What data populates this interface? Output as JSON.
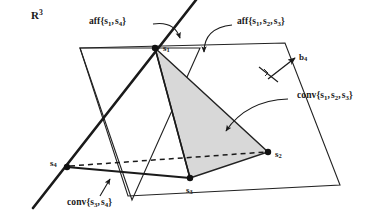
{
  "figure": {
    "caption_space": "R",
    "caption_space_exponent": "3",
    "background_color": "#ffffff",
    "line_color": "#1a1a1a",
    "shade_color": "#d6d6d6",
    "labels": {
      "space": {
        "text": "R",
        "sup": "3"
      },
      "aff_s1_s4": {
        "prefix": "aff",
        "open": "{",
        "items": [
          "s",
          "s"
        ],
        "subs": [
          "1",
          "4"
        ],
        "close": "}"
      },
      "aff_s1_s2_s3": {
        "prefix": "aff",
        "open": "{",
        "items": [
          "s",
          "s",
          "s"
        ],
        "subs": [
          "1",
          "2",
          "3"
        ],
        "close": "}"
      },
      "conv_s1_s2_s3": {
        "prefix": "conv",
        "open": "{",
        "items": [
          "s",
          "s",
          "s"
        ],
        "subs": [
          "1",
          "2",
          "3"
        ],
        "close": "}"
      },
      "conv_s3_s4": {
        "prefix": "conv",
        "open": "{",
        "items": [
          "s",
          "s"
        ],
        "subs": [
          "3",
          "4"
        ],
        "close": "}"
      },
      "b4": {
        "base": "b",
        "sub": "4"
      },
      "s1": {
        "base": "s",
        "sub": "1"
      },
      "s2": {
        "base": "s",
        "sub": "2"
      },
      "s3": {
        "base": "s",
        "sub": "3"
      },
      "s4": {
        "base": "s",
        "sub": "4"
      }
    },
    "points": {
      "s1": {
        "x": 155,
        "y": 48
      },
      "s2": {
        "x": 268,
        "y": 152
      },
      "s3": {
        "x": 190,
        "y": 178
      },
      "s4": {
        "x": 67,
        "y": 167
      }
    },
    "affine_plane_polygon": [
      {
        "x": 80,
        "y": 48
      },
      {
        "x": 285,
        "y": 43
      },
      {
        "x": 340,
        "y": 185
      },
      {
        "x": 128,
        "y": 196
      }
    ],
    "line_plane_polygon": [
      {
        "x": 80,
        "y": 48
      },
      {
        "x": 200,
        "y": 48
      },
      {
        "x": 132,
        "y": 200
      }
    ],
    "shaded_triangle": [
      "s1",
      "s2",
      "s3"
    ],
    "thick_line": [
      {
        "x": 196,
        "y": 0
      },
      {
        "x": 33,
        "y": 208
      }
    ],
    "dashed_segment": [
      {
        "x": 67,
        "y": 167
      },
      {
        "x": 268,
        "y": 152
      }
    ],
    "solid_segment_s3_s4": [
      {
        "x": 67,
        "y": 167
      },
      {
        "x": 190,
        "y": 178
      }
    ],
    "normal_vector_b4": {
      "from": {
        "x": 270,
        "y": 78
      },
      "to": {
        "x": 296,
        "y": 58
      }
    },
    "right_angle_tick": {
      "x": 268,
      "y": 72
    }
  }
}
